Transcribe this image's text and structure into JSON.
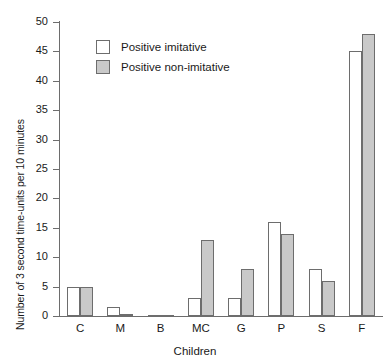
{
  "chart_data": {
    "type": "bar",
    "title": "",
    "subtitle": "",
    "xlabel": "Children",
    "ylabel": "Number of 3 second time-units per 10 minutes",
    "categories": [
      "C",
      "M",
      "B",
      "MC",
      "G",
      "P",
      "S",
      "F"
    ],
    "series": [
      {
        "name": "Positive imitative",
        "color": "#ffffff",
        "edge_color": "#6d6d6d",
        "values": [
          5,
          1.5,
          0,
          3,
          3,
          16,
          8,
          45
        ]
      },
      {
        "name": "Positive non-imitative",
        "color": "#c9c9c9",
        "edge_color": "#6d6d6d",
        "values": [
          5,
          0.3,
          0,
          13,
          8,
          14,
          6,
          48
        ]
      }
    ],
    "ylim": [
      0,
      50
    ],
    "yticks": [
      0,
      5,
      10,
      15,
      20,
      25,
      30,
      35,
      40,
      45,
      50
    ],
    "ytick_labels": [
      "0",
      "5",
      "10",
      "15",
      "20",
      "25",
      "30",
      "35",
      "40",
      "45",
      "50"
    ],
    "grid": false,
    "legend_position": "upper-left-inside",
    "axis_color": "#6d6d6d"
  },
  "legend": {
    "entries": [
      {
        "label": "Positive imitative"
      },
      {
        "label": "Positive non-imitative"
      }
    ]
  }
}
